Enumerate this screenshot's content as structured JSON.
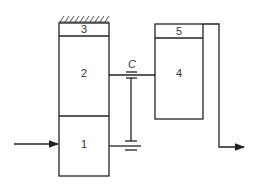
{
  "diagram": {
    "blocks": [
      {
        "id": "1",
        "label": "1"
      },
      {
        "id": "2",
        "label": "2"
      },
      {
        "id": "3",
        "label": "3"
      },
      {
        "id": "4",
        "label": "4"
      },
      {
        "id": "5",
        "label": "5"
      }
    ],
    "coupling_label": "C",
    "colors": {
      "stroke": "#222222",
      "background": "#ffffff"
    }
  }
}
